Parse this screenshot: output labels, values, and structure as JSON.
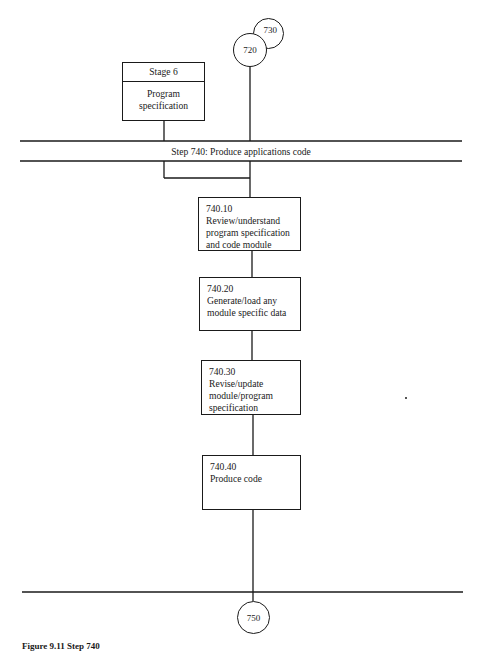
{
  "diagram": {
    "type": "flowchart",
    "connectors_in": [
      {
        "id": "720",
        "label": "720"
      },
      {
        "id": "730",
        "label": "730"
      }
    ],
    "stage_box": {
      "title": "Stage 6",
      "body_line1": "Program",
      "body_line2": "specification"
    },
    "step_band": {
      "label": "Step 740:  Produce applications code"
    },
    "process_boxes": [
      {
        "id": "740.10",
        "number": "740.10",
        "lines": [
          "Review/understand",
          "program specification",
          "and code module"
        ]
      },
      {
        "id": "740.20",
        "number": "740.20",
        "lines": [
          "Generate/load any",
          "module specific data"
        ]
      },
      {
        "id": "740.30",
        "number": "740.30",
        "lines": [
          "Revise/update",
          "module/program",
          "specification"
        ]
      },
      {
        "id": "740.40",
        "number": "740.40",
        "lines": [
          "Produce code"
        ]
      }
    ],
    "connector_out": {
      "id": "750",
      "label": "750"
    },
    "caption": "Figure 9.11  Step 740"
  }
}
